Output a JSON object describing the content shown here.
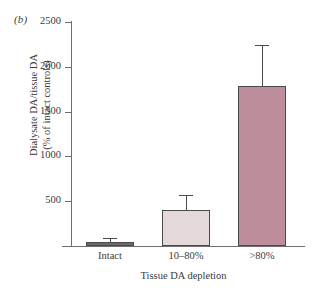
{
  "chart_data": {
    "type": "bar",
    "title": "",
    "panel_label": "(b)",
    "categories": [
      "Intact",
      "10–80%",
      ">80%"
    ],
    "values": [
      50,
      400,
      1790
    ],
    "errors_upper": [
      25,
      155,
      440
    ],
    "series": [
      {
        "name": "Dialysate DA / tissue DA",
        "values": [
          50,
          400,
          1790
        ],
        "errors_upper": [
          25,
          155,
          440
        ]
      }
    ],
    "bar_colors": [
      "#6b6b6b",
      "#e5d8d8",
      "#bd8d9c"
    ],
    "bar_edge_color": "#4a4a4a",
    "xlabel": "Tissue DA depletion",
    "ylabel_line1": "Dialysate DA/tissue DA",
    "ylabel_line2": "(% of intact controls)",
    "ylim": [
      0,
      2500
    ],
    "yticks": [
      500,
      1000,
      1500,
      2000,
      2500
    ],
    "ytick_labels": [
      "500",
      "1000",
      "1500",
      "2000",
      "2500"
    ],
    "grid": false,
    "legend": false,
    "axis_color": "#6f6f6f"
  }
}
